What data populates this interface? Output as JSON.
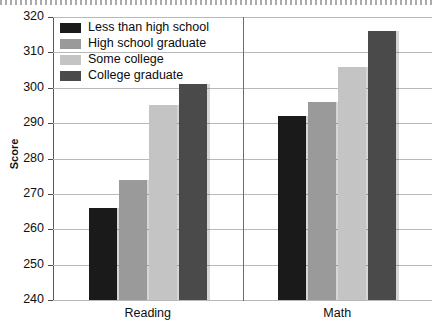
{
  "chart_data": {
    "type": "bar",
    "title": "",
    "xlabel": "",
    "ylabel": "Score",
    "categories": [
      "Reading",
      "Math"
    ],
    "ylim": [
      240,
      320
    ],
    "ytick_step": 10,
    "yticks": [
      320,
      310,
      300,
      290,
      280,
      270,
      260,
      250,
      240
    ],
    "grid": true,
    "legend_position": "top-left-inside",
    "series": [
      {
        "name": "Less than high school",
        "color": "#1a1a1a",
        "values": [
          266,
          292
        ]
      },
      {
        "name": "High school graduate",
        "color": "#9a9a9a",
        "values": [
          274,
          296
        ]
      },
      {
        "name": "Some college",
        "color": "#c4c4c4",
        "values": [
          295,
          306
        ]
      },
      {
        "name": "College graduate",
        "color": "#4a4a4a",
        "values": [
          301,
          316
        ]
      }
    ]
  },
  "axis": {
    "y_title": "Score"
  }
}
